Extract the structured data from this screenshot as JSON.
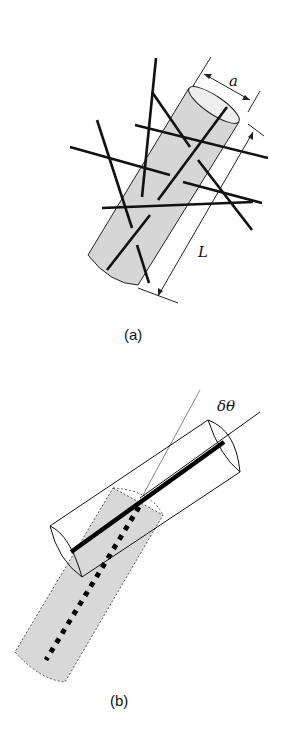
{
  "figure": {
    "panels": [
      {
        "id": "a",
        "caption": "(a)",
        "description": "Cylinder of diameter a and length L among randomly oriented rods",
        "dimension_labels": {
          "diameter": "a",
          "length": "L"
        }
      },
      {
        "id": "b",
        "caption": "(b)",
        "description": "Rod rotated by small angle inside cylinder; shaded original position with dotted rod",
        "angle_label": "δθ"
      }
    ],
    "colors": {
      "line": "#111111",
      "cylinder_fill": "#d9d9d9",
      "background": "#ffffff"
    }
  }
}
